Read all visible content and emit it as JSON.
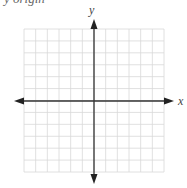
{
  "caption_fragment": "y   origin",
  "chart_data": {
    "type": "coordinate-grid",
    "title": "",
    "xlabel": "x",
    "ylabel": "y",
    "grid": true,
    "grid_cells_x": 12,
    "grid_cells_y": 12,
    "xlim": [
      -6,
      6
    ],
    "ylim": [
      -6,
      6
    ],
    "tick_labels": [],
    "series": []
  },
  "colors": {
    "grid": "#d8d8d8",
    "axis": "#333333",
    "label": "#444444"
  }
}
